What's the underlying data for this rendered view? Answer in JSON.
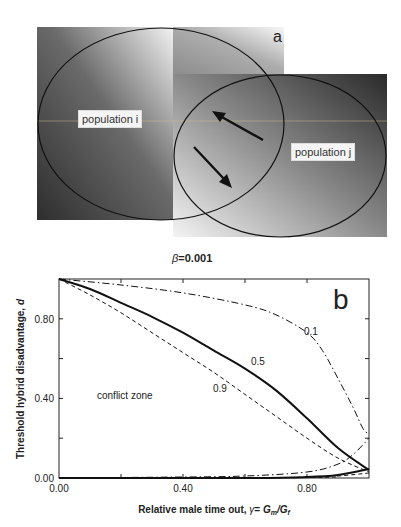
{
  "panel_a": {
    "label": "a",
    "population_i_label": "population i",
    "population_j_label": "population j",
    "colors": {
      "dark": "#3a3a3a",
      "light": "#e8e8e8",
      "outline": "#111111"
    }
  },
  "panel_b": {
    "label": "b",
    "beta_symbol": "β",
    "beta_value": "=0.001",
    "annotation": "conflict zone",
    "curve_labels": [
      "0.1",
      "0.5",
      "0.9"
    ]
  },
  "chart_data": {
    "type": "line",
    "xlabel": "Relative male time out, γ = Gm/Gf",
    "ylabel": "Threshold hybrid disadvantage, d",
    "xlim": [
      0,
      1.0
    ],
    "ylim": [
      0,
      1.0
    ],
    "x_ticks": [
      "0.00",
      "0.40",
      "0.80"
    ],
    "y_ticks": [
      "0.00",
      "0.40",
      "0.80"
    ],
    "grid": false,
    "annotations": [
      "conflict zone",
      "0.1",
      "0.5",
      "0.9",
      "b"
    ],
    "series": [
      {
        "name": "0.1 (upper)",
        "style": "dash-dot",
        "x": [
          0,
          0.2,
          0.4,
          0.6,
          0.7,
          0.8,
          0.85,
          0.9,
          0.95,
          0.98,
          1.0
        ],
        "y": [
          1.0,
          0.97,
          0.93,
          0.87,
          0.82,
          0.73,
          0.64,
          0.5,
          0.35,
          0.25,
          0.22
        ]
      },
      {
        "name": "0.5 (upper)",
        "style": "solid",
        "x": [
          0,
          0.1,
          0.2,
          0.3,
          0.4,
          0.5,
          0.6,
          0.7,
          0.8,
          0.9,
          1.0
        ],
        "y": [
          1.0,
          0.95,
          0.88,
          0.81,
          0.73,
          0.64,
          0.55,
          0.44,
          0.3,
          0.15,
          0.04
        ]
      },
      {
        "name": "0.9 (upper)",
        "style": "dashed",
        "x": [
          0,
          0.1,
          0.2,
          0.3,
          0.4,
          0.5,
          0.6,
          0.7,
          0.8,
          0.9,
          1.0
        ],
        "y": [
          1.0,
          0.92,
          0.83,
          0.73,
          0.63,
          0.53,
          0.42,
          0.31,
          0.2,
          0.1,
          0.03
        ]
      },
      {
        "name": "0.1 (lower)",
        "style": "dash-dot",
        "x": [
          0,
          0.4,
          0.6,
          0.8,
          0.9,
          0.95,
          1.0
        ],
        "y": [
          0.0,
          0.005,
          0.01,
          0.03,
          0.07,
          0.12,
          0.2
        ]
      },
      {
        "name": "0.5 (lower)",
        "style": "solid",
        "x": [
          0,
          0.6,
          0.8,
          0.9,
          1.0
        ],
        "y": [
          0.0,
          0.0,
          0.005,
          0.015,
          0.045
        ]
      },
      {
        "name": "0.9 (lower)",
        "style": "dashed",
        "x": [
          0,
          0.8,
          0.9,
          1.0
        ],
        "y": [
          0.0,
          0.003,
          0.01,
          0.025
        ]
      }
    ]
  }
}
